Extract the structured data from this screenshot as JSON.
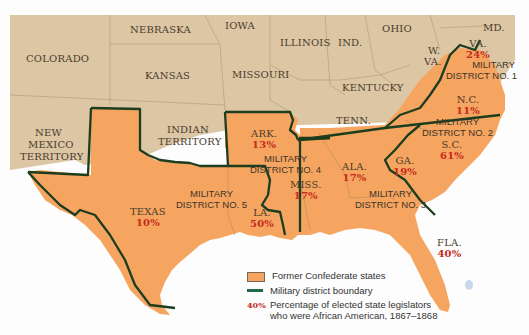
{
  "map": {
    "colors": {
      "confederate": "#f5a560",
      "union": "#dcc6a4",
      "boundary": "#1c3d1e",
      "percent_text": "#c62a1d",
      "water": "#ffffff"
    },
    "non_confederate_labels": [
      {
        "name": "NEBRASKA"
      },
      {
        "name": "IOWA"
      },
      {
        "name": "COLORADO"
      },
      {
        "name": "KANSAS"
      },
      {
        "name": "MISSOURI"
      },
      {
        "name": "ILLINOIS"
      },
      {
        "name": "IND."
      },
      {
        "name": "OHIO"
      },
      {
        "name": "MD."
      },
      {
        "name": "W."
      },
      {
        "name": "VA."
      },
      {
        "name": "KENTUCKY"
      },
      {
        "name": "NEW"
      },
      {
        "name": "MEXICO"
      },
      {
        "name": "TERRITORY"
      },
      {
        "name": "INDIAN"
      },
      {
        "name": "TERRITORY"
      }
    ],
    "confederate_states": [
      {
        "name": "VA.",
        "percent": "24%"
      },
      {
        "name": "N.C.",
        "percent": "11%"
      },
      {
        "name": "S.C.",
        "percent": "61%"
      },
      {
        "name": "TENN.",
        "percent": ""
      },
      {
        "name": "GA.",
        "percent": "19%"
      },
      {
        "name": "ALA.",
        "percent": "17%"
      },
      {
        "name": "FLA.",
        "percent": "40%"
      },
      {
        "name": "MISS.",
        "percent": "17%"
      },
      {
        "name": "ARK.",
        "percent": "13%"
      },
      {
        "name": "LA.",
        "percent": "50%"
      },
      {
        "name": "TEXAS",
        "percent": "10%"
      }
    ],
    "military_districts": [
      {
        "line1": "MILITARY",
        "line2": "DISTRICT NO. 1"
      },
      {
        "line1": "MILITARY",
        "line2": "DISTRICT NO. 2"
      },
      {
        "line1": "MILITARY",
        "line2": "DISTRICT NO. 3"
      },
      {
        "line1": "MILITARY",
        "line2": "DISTRICT NO. 4"
      },
      {
        "line1": "MILITARY",
        "line2": "DISTRICT NO. 5"
      }
    ]
  },
  "legend": {
    "items": [
      {
        "label": "Former Confederate states"
      },
      {
        "label": "Military district boundary"
      },
      {
        "sample": "40%",
        "line1": "Percentage of elected state legislators",
        "line2": "who were African American, 1867–1868"
      }
    ]
  }
}
